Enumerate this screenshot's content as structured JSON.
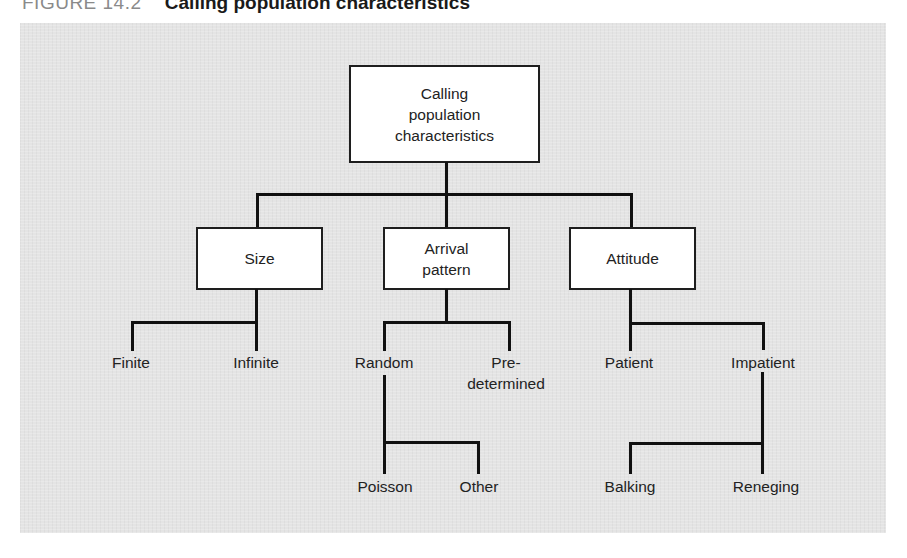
{
  "figure": {
    "number": "FIGURE 14.2",
    "caption": "Calling population characteristics"
  },
  "diagram": {
    "root": {
      "lines": [
        "Calling",
        "population",
        "characteristics"
      ]
    },
    "categories": [
      {
        "id": "size",
        "label": "Size",
        "children": [
          "Finite",
          "Infinite"
        ]
      },
      {
        "id": "arrival",
        "lines": [
          "Arrival",
          "pattern"
        ],
        "children": [
          "Random",
          "Pre-determined"
        ]
      },
      {
        "id": "attitude",
        "label": "Attitude",
        "children": [
          "Patient",
          "Impatient"
        ]
      }
    ],
    "leaves": {
      "finite": "Finite",
      "infinite": "Infinite",
      "random": "Random",
      "predetermined": [
        "Pre-",
        "determined"
      ],
      "patient": "Patient",
      "impatient": "Impatient",
      "poisson": "Poisson",
      "other": "Other",
      "balking": "Balking",
      "reneging": "Reneging"
    },
    "sub_branches": [
      {
        "parent": "Random",
        "children": [
          "Poisson",
          "Other"
        ]
      },
      {
        "parent": "Impatient",
        "children": [
          "Balking",
          "Reneging"
        ]
      }
    ]
  }
}
